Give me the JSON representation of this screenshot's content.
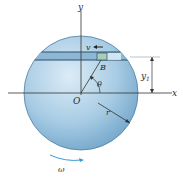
{
  "diagram": {
    "type": "mechanics-rotating-disk-with-slot",
    "labels": {
      "y_axis": "y",
      "x_axis": "x",
      "origin": "O",
      "block": "B",
      "velocity": "v",
      "angle": "θ",
      "radius": "r",
      "dimension": "y",
      "dimension_subscript": "1",
      "angular_velocity": "ω"
    },
    "colors": {
      "disk_light": "#d4e7f3",
      "disk_mid": "#9ec6e0",
      "disk_dark": "#5f97bf",
      "slot": "#8fb8d6",
      "block": "#a9cdb8",
      "omega_arrow": "#3a9ad9",
      "line": "#333333"
    }
  }
}
